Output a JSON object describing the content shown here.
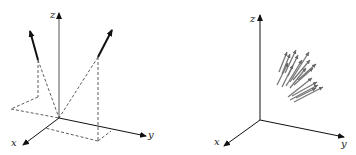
{
  "figure": {
    "left": {
      "axes": {
        "x_label": "x",
        "y_label": "y",
        "z_label": "z"
      },
      "description": "Two vectors with dashed projections onto the xy-plane"
    },
    "right": {
      "axes": {
        "x_label": "x",
        "y_label": "y",
        "z_label": "z"
      },
      "description": "Cluster of many gray vectors"
    },
    "colors": {
      "axis": "#111111",
      "vector": "#111111",
      "cluster": "#777777",
      "dashed": "#333333"
    }
  }
}
